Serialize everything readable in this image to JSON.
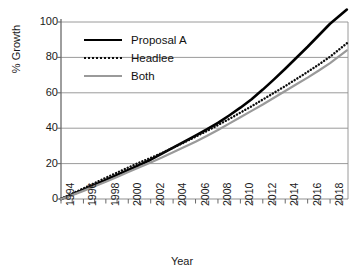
{
  "chart_data": {
    "type": "line",
    "title": "",
    "xlabel": "Year",
    "ylabel": "% Growth",
    "xlim": [
      1994,
      2019.6
    ],
    "ylim": [
      0,
      107
    ],
    "grid": true,
    "legend_position": "upper-left",
    "y_ticks": [
      0,
      20,
      40,
      60,
      80,
      100
    ],
    "x_ticks": [
      1994,
      1996,
      1998,
      2000,
      2002,
      2004,
      2006,
      2008,
      2010,
      2012,
      2014,
      2016,
      2018
    ],
    "x_tick_labels": [
      "1994",
      "1996",
      "1998",
      "2000",
      "2002",
      "2004",
      "2006",
      "2008",
      "2010",
      "2012",
      "2014",
      "2016",
      "2018"
    ],
    "x_minor_ticks": [
      1995,
      1997,
      1999,
      2001,
      2003,
      2005,
      2007,
      2009,
      2011,
      2013,
      2015,
      2017,
      2019
    ],
    "x": [
      1994,
      1995,
      1996,
      1997,
      1998,
      1999,
      2000,
      2001,
      2002,
      2003,
      2004,
      2005,
      2006,
      2007,
      2008,
      2009,
      2010,
      2011,
      2012,
      2013,
      2014,
      2015,
      2016,
      2017,
      2018,
      2019.5
    ],
    "series": [
      {
        "name": "Proposal A",
        "color": "#000000",
        "style": "solid",
        "width": 2.6,
        "values": [
          0,
          2.5,
          5.2,
          8.0,
          10.8,
          13.6,
          16.4,
          19.2,
          22.2,
          25.6,
          29.0,
          32.4,
          35.8,
          39.3,
          43.0,
          47.2,
          51.6,
          56.4,
          61.8,
          67.6,
          73.6,
          79.8,
          86.0,
          92.5,
          99.0,
          107.0
        ]
      },
      {
        "name": "Headlee",
        "color": "#0d0d0d",
        "style": "dotted",
        "width": 2.4,
        "values": [
          0,
          3.0,
          6.0,
          9.0,
          12.0,
          14.9,
          17.8,
          20.6,
          23.2,
          26.0,
          29.0,
          32.0,
          35.2,
          38.4,
          41.8,
          45.2,
          48.8,
          52.4,
          56.2,
          60.0,
          63.8,
          67.8,
          71.8,
          76.0,
          80.4,
          88.0
        ]
      },
      {
        "name": "Both",
        "color": "#9a9a9a",
        "style": "solid",
        "width": 2.2,
        "values": [
          0,
          2.2,
          4.6,
          7.2,
          9.8,
          12.4,
          15.2,
          18.0,
          20.6,
          23.4,
          26.4,
          29.4,
          32.4,
          35.6,
          39.0,
          42.6,
          46.2,
          49.8,
          53.4,
          57.2,
          61.0,
          64.8,
          68.6,
          72.6,
          76.8,
          84.0
        ]
      }
    ]
  },
  "legend": {
    "items": [
      {
        "label": "Proposal A"
      },
      {
        "label": "Headlee"
      },
      {
        "label": "Both"
      }
    ]
  },
  "axes": {
    "y_title": "% Growth",
    "x_title": "Year"
  }
}
